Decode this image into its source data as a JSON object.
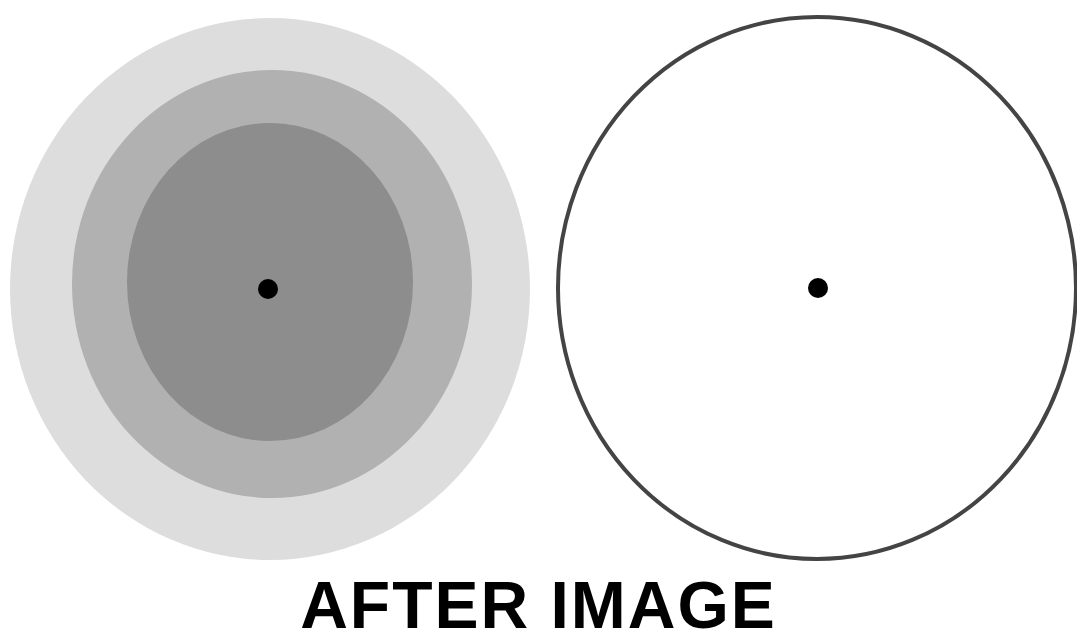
{
  "caption": "AFTER IMAGE",
  "left_target": {
    "rings": [
      {
        "name": "outer-ring",
        "cx": 270,
        "cy": 289,
        "rx": 260,
        "ry": 271,
        "color": "#dddddd"
      },
      {
        "name": "middle-ring",
        "cx": 272,
        "cy": 284,
        "rx": 200,
        "ry": 214,
        "color": "#b1b1b1"
      },
      {
        "name": "inner-disk",
        "cx": 270,
        "cy": 282,
        "rx": 143,
        "ry": 159,
        "color": "#8d8d8d"
      }
    ],
    "fixation_dot": {
      "cx": 268,
      "cy": 289,
      "r": 10,
      "color": "#000000"
    }
  },
  "right_target": {
    "outline": {
      "cx": 817,
      "cy": 288,
      "rx": 259,
      "ry": 271,
      "stroke": "#444444",
      "stroke_width": 4
    },
    "fixation_dot": {
      "cx": 818,
      "cy": 288,
      "r": 10,
      "color": "#000000"
    }
  }
}
